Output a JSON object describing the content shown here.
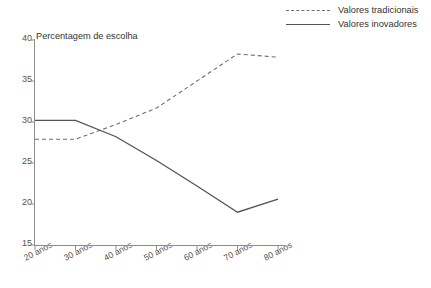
{
  "chart_data": {
    "type": "line",
    "title": "Percentagem de escolha",
    "xlabel": "",
    "ylabel": "",
    "categories": [
      "20 anos",
      "30 anos",
      "40 anos",
      "50 anos",
      "60 anos",
      "70 anos",
      "80 anos"
    ],
    "series": [
      {
        "name": "Valores tradicionais",
        "style": "dashed",
        "color": "#6f6f6d",
        "values": [
          27.9,
          27.9,
          29.7,
          31.7,
          35.0,
          38.3,
          37.9
        ]
      },
      {
        "name": "Valores inovadores",
        "style": "solid",
        "color": "#55544f",
        "values": [
          30.2,
          30.2,
          28.2,
          25.3,
          22.2,
          19.0,
          20.6
        ]
      }
    ],
    "ylim": [
      15,
      40
    ],
    "yticks": [
      15,
      20,
      25,
      30,
      35,
      40
    ],
    "ytick_labels": [
      "15",
      "20",
      "25",
      "30",
      "35",
      "40"
    ],
    "grid": false,
    "legend_position": "top-right"
  },
  "legend": {
    "items": [
      {
        "label": "Valores tradicionais",
        "style": "dashed"
      },
      {
        "label": "Valores inovadores",
        "style": "solid"
      }
    ]
  },
  "axes": {
    "title": "Percentagem de escolha",
    "axis_color": "#8d8c86"
  }
}
